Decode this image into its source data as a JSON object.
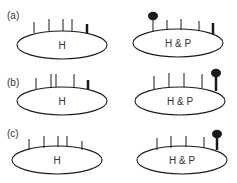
{
  "colors": {
    "stroke": "#1a1a1a",
    "text": "#333333",
    "background": "#ffffff"
  },
  "rows": [
    {
      "label": "(a)",
      "label_pos": [
        7,
        19
      ],
      "left": {
        "text": "H",
        "cx": 62,
        "cy": 45,
        "rx": 45,
        "ry": 14,
        "ticks": [
          {
            "x": 34,
            "top": 22,
            "base": 33,
            "w": 1
          },
          {
            "x": 49,
            "top": 19,
            "base": 31,
            "w": 1
          },
          {
            "x": 63,
            "top": 19,
            "base": 31,
            "w": 1
          },
          {
            "x": 72,
            "top": 19,
            "base": 31,
            "w": 1
          },
          {
            "x": 87,
            "top": 24,
            "base": 34,
            "w": 2.5
          }
        ]
      },
      "right": {
        "text": "H & P",
        "cx": 178,
        "cy": 43,
        "rx": 45,
        "ry": 14,
        "ticks": [
          {
            "x": 153,
            "top": 16,
            "base": 32,
            "w": 1,
            "ball": true
          },
          {
            "x": 167,
            "top": 20,
            "base": 30,
            "w": 1
          },
          {
            "x": 181,
            "top": 19,
            "base": 30,
            "w": 1
          },
          {
            "x": 199,
            "top": 21,
            "base": 31,
            "w": 1
          },
          {
            "x": 213,
            "top": 23,
            "base": 34,
            "w": 2.5
          }
        ]
      }
    },
    {
      "label": "(b)",
      "label_pos": [
        7,
        86
      ],
      "left": {
        "text": "H",
        "cx": 62,
        "cy": 101,
        "rx": 45,
        "ry": 14,
        "ticks": [
          {
            "x": 36,
            "top": 78,
            "base": 89,
            "w": 1
          },
          {
            "x": 51,
            "top": 74,
            "base": 87,
            "w": 1
          },
          {
            "x": 56,
            "top": 74,
            "base": 87,
            "w": 1
          },
          {
            "x": 74,
            "top": 74,
            "base": 87,
            "w": 1
          },
          {
            "x": 88,
            "top": 80,
            "base": 90,
            "w": 2.5
          }
        ]
      },
      "right": {
        "text": "H & P",
        "cx": 180,
        "cy": 101,
        "rx": 45,
        "ry": 14,
        "ticks": [
          {
            "x": 154,
            "top": 76,
            "base": 90,
            "w": 1
          },
          {
            "x": 169,
            "top": 73,
            "base": 87,
            "w": 1
          },
          {
            "x": 184,
            "top": 73,
            "base": 87,
            "w": 1
          },
          {
            "x": 202,
            "top": 74,
            "base": 88,
            "w": 1
          },
          {
            "x": 216,
            "top": 73,
            "base": 91,
            "w": 2.5,
            "ball": true
          }
        ]
      }
    },
    {
      "label": "(c)",
      "label_pos": [
        7,
        137
      ],
      "left": {
        "text": "H",
        "cx": 57,
        "cy": 160,
        "rx": 45,
        "ry": 14,
        "ticks": [
          {
            "x": 29,
            "top": 139,
            "base": 150,
            "w": 1
          },
          {
            "x": 44,
            "top": 136,
            "base": 148,
            "w": 1
          },
          {
            "x": 58,
            "top": 136,
            "base": 147,
            "w": 1
          },
          {
            "x": 67,
            "top": 136,
            "base": 147,
            "w": 1
          },
          {
            "x": 82,
            "top": 141,
            "base": 150,
            "w": 1
          }
        ]
      },
      "right": {
        "text": "H & P",
        "cx": 182,
        "cy": 160,
        "rx": 45,
        "ry": 14,
        "ticks": [
          {
            "x": 157,
            "top": 138,
            "base": 150,
            "w": 1
          },
          {
            "x": 171,
            "top": 136,
            "base": 148,
            "w": 1
          },
          {
            "x": 186,
            "top": 136,
            "base": 147,
            "w": 1
          },
          {
            "x": 204,
            "top": 137,
            "base": 148,
            "w": 1
          },
          {
            "x": 217,
            "top": 134,
            "base": 150,
            "w": 2.5,
            "ball": true
          }
        ]
      }
    }
  ]
}
